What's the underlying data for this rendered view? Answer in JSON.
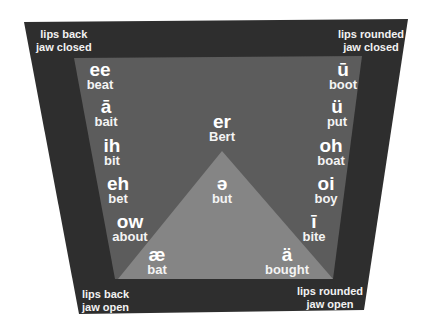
{
  "colors": {
    "background": "#ffffff",
    "outer_frame": "#2e2e2e",
    "inner_area": "#5c5c5c",
    "triangle": "#858585",
    "text": "#ffffff"
  },
  "corners": {
    "top_left": {
      "line1": "lips back",
      "line2": "jaw closed"
    },
    "top_right": {
      "line1": "lips rounded",
      "line2": "jaw closed"
    },
    "bottom_left": {
      "line1": "lips back",
      "line2": "jaw open"
    },
    "bottom_right": {
      "line1": "lips rounded",
      "line2": "jaw open"
    }
  },
  "left_vowels": [
    {
      "symbol": "ee",
      "word": "beat"
    },
    {
      "symbol": "ā",
      "word": "bait"
    },
    {
      "symbol": "ih",
      "word": "bit"
    },
    {
      "symbol": "eh",
      "word": "bet"
    },
    {
      "symbol": "ow",
      "word": "about"
    }
  ],
  "right_vowels": [
    {
      "symbol": "ū",
      "word": "boot"
    },
    {
      "symbol": "ü",
      "word": "put"
    },
    {
      "symbol": "oh",
      "word": "boat"
    },
    {
      "symbol": "oi",
      "word": "boy"
    },
    {
      "symbol": "ī",
      "word": "bite"
    }
  ],
  "center_vowels": [
    {
      "symbol": "er",
      "word": "Bert"
    },
    {
      "symbol": "ə",
      "word": "but"
    }
  ],
  "bottom_vowels": [
    {
      "symbol": "æ",
      "word": "bat"
    },
    {
      "symbol": "ä",
      "word": "bought"
    }
  ]
}
